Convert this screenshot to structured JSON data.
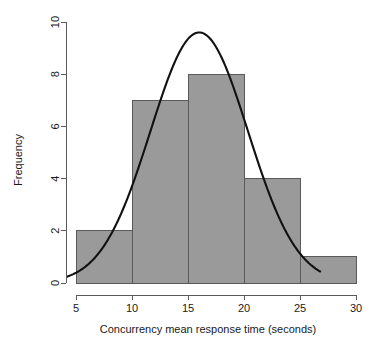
{
  "chart_data": {
    "type": "bar",
    "title": "",
    "subtitle": "",
    "xlabel": "Concurrency mean response time (seconds)",
    "ylabel": "Frequency",
    "xlim": [
      4,
      30.5
    ],
    "ylim": [
      0,
      10
    ],
    "grid": false,
    "legend": "none",
    "bin_width": 5,
    "bin_edges": [
      5,
      10,
      15,
      20,
      25,
      30
    ],
    "categories": [
      "5-10",
      "10-15",
      "15-20",
      "20-25",
      "25-30"
    ],
    "values": [
      2,
      7,
      8,
      4,
      1
    ],
    "bins": [
      {
        "label": "5-10",
        "start": 5,
        "end": 10,
        "frequency": 2
      },
      {
        "label": "10-15",
        "start": 10,
        "end": 15,
        "frequency": 7
      },
      {
        "label": "15-20",
        "start": 15,
        "end": 20,
        "frequency": 8
      },
      {
        "label": "20-25",
        "start": 20,
        "end": 25,
        "frequency": 4
      },
      {
        "label": "25-30",
        "start": 25,
        "end": 30,
        "frequency": 1
      }
    ],
    "x_ticks": [
      5,
      10,
      15,
      20,
      25,
      30
    ],
    "x_tick_labels": [
      "5",
      "10",
      "15",
      "20",
      "25",
      "30"
    ],
    "y_ticks": [
      0,
      2,
      4,
      6,
      8,
      10
    ],
    "y_tick_labels": [
      "0",
      "2",
      "4",
      "6",
      "8",
      "10"
    ],
    "overlay": {
      "name": "normal-density-curve",
      "type": "line",
      "peak_x": 16.0,
      "peak_y": 9.6,
      "mean": 16.0,
      "sigma": 4.35,
      "scale": 22,
      "x_start": 4.2,
      "x_end": 26.8,
      "x": [
        4.2,
        5.0,
        6.0,
        7.0,
        8.0,
        9.0,
        10.0,
        11.0,
        12.0,
        13.0,
        14.0,
        15.0,
        16.0,
        17.0,
        18.0,
        19.0,
        20.0,
        21.0,
        22.0,
        23.0,
        24.0,
        25.0,
        26.0,
        26.8
      ],
      "y": [
        0.28,
        0.38,
        0.58,
        0.88,
        1.3,
        1.9,
        2.7,
        3.7,
        4.9,
        6.2,
        7.5,
        8.8,
        9.55,
        9.45,
        8.8,
        7.8,
        6.5,
        5.2,
        4.0,
        2.9,
        2.0,
        1.35,
        0.88,
        0.65
      ],
      "color": "#111111",
      "width": 2.1
    },
    "colors": {
      "bar_fill": "#9a9a9a",
      "bar_border": "#5a5a5a",
      "axis": "#5a5a5a",
      "curve": "#111111",
      "text": "#1a1a1a",
      "background": "#ffffff"
    }
  }
}
